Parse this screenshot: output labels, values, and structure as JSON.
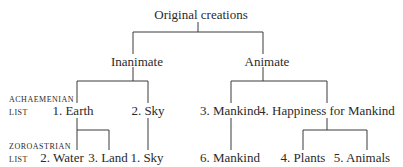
{
  "diagram": {
    "type": "tree",
    "root": "Original creations",
    "level1": [
      "Inanimate",
      "Animate"
    ],
    "row_labels": {
      "achaemenian": [
        "ACHAEMENIAN",
        "LIST"
      ],
      "zoroastrian": [
        "ZOROASTRIAN",
        "LIST"
      ]
    },
    "achaemenian_list": [
      "1. Earth",
      "2. Sky",
      "3. Mankind",
      "4. Happiness for Mankind"
    ],
    "zoroastrian_list": [
      "2. Water",
      "3. Land",
      "1. Sky",
      "6. Mankind",
      "4. Plants",
      "5. Animals"
    ],
    "edges": [
      [
        "Original creations",
        "Inanimate"
      ],
      [
        "Original creations",
        "Animate"
      ],
      [
        "Inanimate",
        "1. Earth"
      ],
      [
        "Inanimate",
        "2. Sky"
      ],
      [
        "Animate",
        "3. Mankind"
      ],
      [
        "Animate",
        "4. Happiness for Mankind"
      ],
      [
        "1. Earth",
        "2. Water"
      ],
      [
        "1. Earth",
        "3. Land"
      ],
      [
        "2. Sky",
        "1. Sky"
      ],
      [
        "3. Mankind",
        "6. Mankind"
      ],
      [
        "4. Happiness for Mankind",
        "4. Plants"
      ],
      [
        "4. Happiness for Mankind",
        "5. Animals"
      ]
    ]
  }
}
